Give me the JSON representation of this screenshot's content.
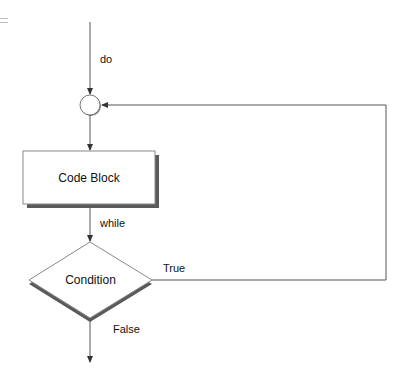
{
  "menu_icon": "hamburger-menu-icon",
  "diagram": {
    "type": "flowchart",
    "nodes": {
      "junction": {
        "shape": "circle"
      },
      "code_block": {
        "shape": "rectangle",
        "label": "Code Block"
      },
      "condition": {
        "shape": "diamond",
        "label": "Condition"
      }
    },
    "edges": {
      "entry": {
        "label": "do"
      },
      "to_condition": {
        "label": "while"
      },
      "true_branch": {
        "label": "True"
      },
      "false_branch": {
        "label": "False"
      }
    },
    "colors": {
      "line": "#555555",
      "shadow": "#5a5a5a",
      "node_border": "#777777",
      "node_fill": "#ffffff"
    }
  }
}
